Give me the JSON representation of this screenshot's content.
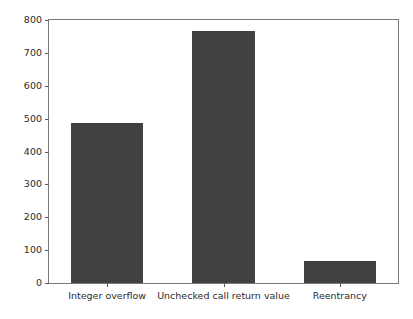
{
  "chart_data": {
    "type": "bar",
    "title": "",
    "xlabel": "",
    "ylabel": "",
    "categories": [
      "Integer overflow",
      "Unchecked call return value",
      "Reentrancy"
    ],
    "values": [
      487,
      767,
      66
    ],
    "series": [
      {
        "name": "Vulnerability count",
        "values": [
          487,
          767,
          66
        ]
      }
    ],
    "ylim": [
      0,
      800
    ],
    "yticks": [
      0,
      100,
      200,
      300,
      400,
      500,
      600,
      700,
      800
    ],
    "ytick_labels": [
      "0",
      "100",
      "200",
      "300",
      "400",
      "500",
      "600",
      "700",
      "800"
    ],
    "xtick_labels": [
      "Integer overflow",
      "Unchecked call return value",
      "Reentrancy"
    ],
    "grid": false,
    "legend": null,
    "legend_position": "none",
    "bar_color": "#414141",
    "axes_color": "#7a7a7a",
    "text_color": "#2b2b2b",
    "background_color": "#ffffff",
    "bar_geometry": [
      {
        "center_frac": 0.1667,
        "width_frac": 0.2051
      },
      {
        "center_frac": 0.5,
        "width_frac": 0.1795
      },
      {
        "center_frac": 0.8333,
        "width_frac": 0.2051
      }
    ]
  }
}
